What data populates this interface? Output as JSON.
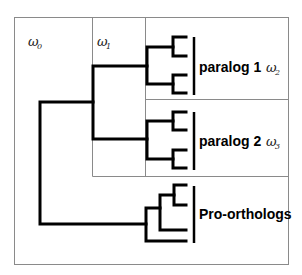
{
  "figure": {
    "regions": [
      {
        "id": "omega0",
        "symbol": "ω",
        "subscript": "0"
      },
      {
        "id": "omega1",
        "symbol": "ω",
        "subscript": "1"
      },
      {
        "id": "omega2",
        "symbol": "ω",
        "subscript": "2"
      },
      {
        "id": "omega3",
        "symbol": "ω",
        "subscript": "3"
      }
    ],
    "clades": [
      {
        "id": "paralog1",
        "label": "paralog 1"
      },
      {
        "id": "paralog2",
        "label": "paralog 2"
      },
      {
        "id": "pro_orthologs",
        "label": "Pro-orthologs"
      }
    ]
  }
}
